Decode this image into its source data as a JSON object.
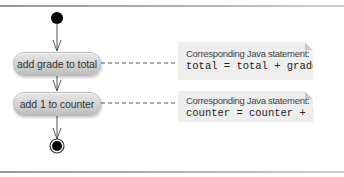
{
  "diagram": {
    "type": "uml-activity-diagram",
    "initial_node": {
      "label": ""
    },
    "actions": [
      {
        "label": "add grade to total"
      },
      {
        "label": "add 1 to counter"
      }
    ],
    "notes": [
      {
        "caption": "Corresponding Java statement:",
        "code": "total = total + grade;"
      },
      {
        "caption": "Corresponding Java statement:",
        "code": "counter = counter + 1;"
      }
    ],
    "final_node": {
      "label": ""
    },
    "colors": {
      "action_fill": "#d2d2d2",
      "note_fill": "#eeeeee",
      "node_fill": "#000000",
      "line": "#555555"
    }
  }
}
